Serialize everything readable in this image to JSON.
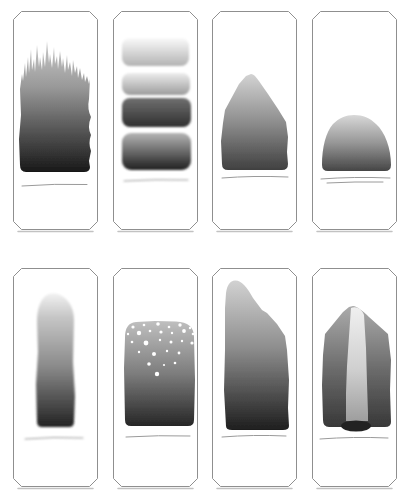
{
  "page": {
    "background": "#ffffff"
  },
  "diagram": {
    "panel_border_color": "#8f8f8f",
    "panel_fill": "#ffffff",
    "panel_shadow_color": "#c2c2c2",
    "baseline_color": "#9a9a9a",
    "speckle_color": "#ffffff",
    "chamfer": 8,
    "panel_size": {
      "width": 85,
      "height": 219
    },
    "grid": {
      "rows": 2,
      "cols": 4,
      "xs": [
        13,
        113,
        212,
        312
      ],
      "ys": [
        11,
        268
      ]
    },
    "panels": [
      {
        "name": "jagged-top-column",
        "blur": 0.4,
        "gradients": [
          {
            "id": "g",
            "y1": 30,
            "y2": 161,
            "stops": [
              {
                "o": 0,
                "c": "#c9c9c9"
              },
              {
                "o": 0.35,
                "c": "#999999"
              },
              {
                "o": 0.6,
                "c": "#666666"
              },
              {
                "o": 1,
                "c": "#181818"
              }
            ]
          }
        ],
        "shapes": [
          {
            "type": "path",
            "name": "stain-shape",
            "fill": "@g",
            "d": "M 7 154 L 6 128 L 8 104 L 7 78 L 9 63 L 10 70 L 12 52 L 13 66 L 15 46 L 16 62 L 18 38 L 19 59 L 21 48 L 22 61 L 24 34 L 26 56 L 27 46 L 29 59 L 30 41 L 32 56 L 34 30 L 36 52 L 37 43 L 39 57 L 41 36 L 42 53 L 44 45 L 45 58 L 47 40 L 49 56 L 50 47 L 52 62 L 54 44 L 55 59 L 57 51 L 59 65 L 60 49 L 62 62 L 64 55 L 65 67 L 67 57 L 69 69 L 71 62 L 72 71 L 74 65 L 76 73 L 77 68 L 76 88 Q 74 98 78 106 Q 74 116 78 124 Q 75 132 78 140 L 76 150 L 77 156 Q 77 161 71 161 L 13 161 Q 7 161 7 154 Z"
          }
        ],
        "baselines": [
          "M 9 175 Q 42 172.5 74 173.5"
        ]
      },
      {
        "name": "stacked-bands",
        "blur": 0.8,
        "gradients": [
          {
            "id": "b1",
            "y1": 27,
            "y2": 55,
            "stops": [
              {
                "o": 0,
                "c": "#fafafa"
              },
              {
                "o": 1,
                "c": "#b3b3b3"
              }
            ]
          },
          {
            "id": "b2",
            "y1": 62,
            "y2": 84,
            "stops": [
              {
                "o": 0,
                "c": "#ededed"
              },
              {
                "o": 1,
                "c": "#9c9c9c"
              }
            ]
          },
          {
            "id": "b3",
            "y1": 87,
            "y2": 116,
            "stops": [
              {
                "o": 0,
                "c": "#707070"
              },
              {
                "o": 1,
                "c": "#2f2f2f"
              }
            ]
          },
          {
            "id": "b4",
            "y1": 122,
            "y2": 159,
            "stops": [
              {
                "o": 0,
                "c": "#b5b5b5"
              },
              {
                "o": 1,
                "c": "#1f1f1f"
              }
            ]
          }
        ],
        "shapes": [
          {
            "type": "rect",
            "name": "band-shape",
            "fill": "@b1",
            "x": 9,
            "y": 27,
            "w": 67,
            "h": 28,
            "rx": 8
          },
          {
            "type": "rect",
            "name": "band-shape",
            "fill": "@b2",
            "x": 9,
            "y": 62,
            "w": 68,
            "h": 22,
            "rx": 8
          },
          {
            "type": "rect",
            "name": "band-shape",
            "fill": "@b3",
            "x": 9,
            "y": 87,
            "w": 69,
            "h": 29,
            "rx": 8
          },
          {
            "type": "rect",
            "name": "band-shape",
            "fill": "@b4",
            "x": 9,
            "y": 122,
            "w": 69,
            "h": 37,
            "rx": 9
          }
        ],
        "baselines": [
          "M 11 170 Q 43 168 75 169"
        ]
      },
      {
        "name": "peaked-mound",
        "blur": 0.6,
        "gradients": [
          {
            "id": "g",
            "y1": 63,
            "y2": 159,
            "stops": [
              {
                "o": 0,
                "c": "#d3d3d3"
              },
              {
                "o": 0.5,
                "c": "#8e8e8e"
              },
              {
                "o": 1,
                "c": "#404040"
              }
            ]
          }
        ],
        "shapes": [
          {
            "type": "path",
            "name": "stain-shape",
            "fill": "@g",
            "d": "M 10 153 L 9 130 L 11 112 L 13 99 L 27 73 L 34 65 L 39 63 C 42 63 45 67 49 73 L 56 83 L 66 98 L 74 111 L 76 126 L 75 141 L 76 153 Q 76 159 70 159 L 16 159 Q 10 159 10 153 Z"
          }
        ],
        "baselines": [
          "M 10 167 Q 41 164.5 76 166"
        ]
      },
      {
        "name": "low-mound",
        "blur": 0.6,
        "gradients": [
          {
            "id": "g",
            "y1": 104,
            "y2": 160,
            "stops": [
              {
                "o": 0,
                "c": "#d8d8d8"
              },
              {
                "o": 0.5,
                "c": "#969696"
              },
              {
                "o": 1,
                "c": "#454545"
              }
            ]
          }
        ],
        "shapes": [
          {
            "type": "path",
            "name": "stain-shape",
            "fill": "@g",
            "d": "M 10 154 C 10 136 14 121 21 113 C 27 107 34 104 42 104 C 51 104 58 107 64 113 C 73 121 79 137 79 154 Q 79 160 73 160 L 16 160 Q 10 160 10 154 Z"
          }
        ],
        "baselines": [
          "M 9 168 Q 41 165.5 78 167",
          "M 15 172 Q 43 170.5 71 171"
        ]
      },
      {
        "name": "narrow-column",
        "blur": 0.9,
        "gradients": [
          {
            "id": "g",
            "y1": 25,
            "y2": 159,
            "stops": [
              {
                "o": 0,
                "c": "#f2f2f2"
              },
              {
                "o": 0.18,
                "c": "#c6c6c6"
              },
              {
                "o": 0.55,
                "c": "#8a8a8a"
              },
              {
                "o": 1,
                "c": "#232323"
              }
            ]
          }
        ],
        "shapes": [
          {
            "type": "path",
            "name": "stain-shape",
            "fill": "@g",
            "d": "M 24 154 L 23 116 L 25 84 L 24 54 C 24 40 28 30 34 27 C 38 25 44 25 48 27.5 C 56 32 61 40 61 52 L 60 94 L 62 128 L 61 154 Q 61 159 56 159 L 29 159 Q 24 159 24 154 Z"
          }
        ],
        "baselines": [
          "M 12 171 Q 41 168.5 70 170"
        ]
      },
      {
        "name": "speckled-column",
        "blur": 0.6,
        "gradients": [
          {
            "id": "g",
            "y1": 53,
            "y2": 158,
            "stops": [
              {
                "o": 0,
                "c": "#bfbfbf"
              },
              {
                "o": 0.5,
                "c": "#7d7d7d"
              },
              {
                "o": 1,
                "c": "#262626"
              }
            ]
          }
        ],
        "shapes": [
          {
            "type": "path",
            "name": "stain-shape",
            "fill": "@g",
            "d": "M 12 152 L 11 100 L 12 70 C 12 60 15 55 23 54 L 42 53 L 63 53.5 C 75 54 81 59 81 69 L 82 112 L 81 152 Q 81 158 75 158 L 18 158 Q 12 158 12 152 Z"
          }
        ],
        "dots": [
          {
            "x": 20,
            "y": 59,
            "r": 1.6
          },
          {
            "x": 31,
            "y": 57,
            "r": 1.3
          },
          {
            "x": 45,
            "y": 56,
            "r": 1.8
          },
          {
            "x": 56,
            "y": 59,
            "r": 1.3
          },
          {
            "x": 67,
            "y": 57,
            "r": 1.7
          },
          {
            "x": 77,
            "y": 60,
            "r": 1.2
          },
          {
            "x": 15,
            "y": 66,
            "r": 1.2
          },
          {
            "x": 26,
            "y": 65,
            "r": 2.2
          },
          {
            "x": 37,
            "y": 63,
            "r": 1.3
          },
          {
            "x": 48,
            "y": 64,
            "r": 1.6
          },
          {
            "x": 59,
            "y": 65,
            "r": 1.2
          },
          {
            "x": 71,
            "y": 63,
            "r": 1.9
          },
          {
            "x": 80,
            "y": 66,
            "r": 1.3
          },
          {
            "x": 19,
            "y": 74,
            "r": 1.3
          },
          {
            "x": 33,
            "y": 75,
            "r": 2.4
          },
          {
            "x": 47,
            "y": 72,
            "r": 1.2
          },
          {
            "x": 58,
            "y": 74,
            "r": 1.5
          },
          {
            "x": 69,
            "y": 73,
            "r": 1.2
          },
          {
            "x": 79,
            "y": 75,
            "r": 1.6
          },
          {
            "x": 26,
            "y": 84,
            "r": 1.2
          },
          {
            "x": 41,
            "y": 86,
            "r": 2.0
          },
          {
            "x": 54,
            "y": 83,
            "r": 1.2
          },
          {
            "x": 66,
            "y": 85,
            "r": 1.4
          },
          {
            "x": 36,
            "y": 96,
            "r": 1.8
          },
          {
            "x": 51,
            "y": 97,
            "r": 1.1
          },
          {
            "x": 62,
            "y": 95,
            "r": 1.3
          },
          {
            "x": 44,
            "y": 106,
            "r": 2.2
          }
        ],
        "baselines": [
          "M 13 169 Q 46 167 77 168"
        ]
      },
      {
        "name": "sloped-peak-column",
        "blur": 0.5,
        "gradients": [
          {
            "id": "g",
            "y1": 12,
            "y2": 162,
            "stops": [
              {
                "o": 0,
                "c": "#d2d2d2"
              },
              {
                "o": 0.45,
                "c": "#8e8e8e"
              },
              {
                "o": 1,
                "c": "#1e1e1e"
              }
            ]
          }
        ],
        "shapes": [
          {
            "type": "path",
            "name": "stain-shape",
            "fill": "@g",
            "d": "M 14 158 L 12 122 L 13 82 L 13 40 L 14 25 C 15 17 18 13 23 12.5 C 29 12 35 19 41 30 L 50 42 L 55 45 L 65 56 L 73 68 L 75 82 L 77 112 L 76 140 L 77 158 Q 77 162 71 162 L 20 162 Q 14 162 14 158 Z"
          }
        ],
        "baselines": [
          "M 10 169 Q 41 166.5 74 168"
        ]
      },
      {
        "name": "split-column-with-light-channel",
        "blur": 0.6,
        "gradients": [
          {
            "id": "g",
            "y1": 38,
            "y2": 159,
            "stops": [
              {
                "o": 0,
                "c": "#ababab"
              },
              {
                "o": 0.5,
                "c": "#6e6e6e"
              },
              {
                "o": 1,
                "c": "#383838"
              }
            ]
          },
          {
            "id": "s",
            "y1": 39,
            "y2": 153,
            "stops": [
              {
                "o": 0,
                "c": "#f0f0f0"
              },
              {
                "o": 0.55,
                "c": "#cfcfcf"
              },
              {
                "o": 1,
                "c": "#9e9e9e"
              }
            ]
          }
        ],
        "shapes": [
          {
            "type": "path",
            "name": "stain-shape",
            "fill": "@g",
            "d": "M 11 152 L 10 117 L 11 87 L 13 66 L 31 44 L 37 39 L 41 38 C 45 38.5 51 43 57 49 L 76 66 L 79 92 L 78 122 L 79 154 Q 79 159 73 159 L 17 159 Q 11 159 11 152 Z"
          },
          {
            "type": "path",
            "name": "channel-stripe",
            "fill": "@s",
            "d": "M 39 40 C 41 39 44 39 46 40 C 49 41.5 51 44 52 47 L 54 80 L 55 115 L 56 145 L 56 153 L 34 153 L 34 125 L 35 98 L 37 68 Z"
          },
          {
            "type": "ellipse",
            "name": "pool-ellipse",
            "fill": "#242424",
            "cx": 44,
            "cy": 158,
            "rx": 15,
            "ry": 5.5
          }
        ],
        "baselines": [
          "M 8 171 Q 41 168.5 76 170"
        ]
      }
    ]
  }
}
